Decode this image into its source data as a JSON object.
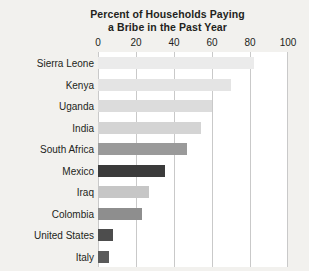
{
  "chart_data": {
    "type": "bar",
    "orientation": "horizontal",
    "title": "Percent of Households Paying a Bribe in the Past Year",
    "title_line1": "Percent of Households Paying",
    "title_line2": "a Bribe in the Past Year",
    "xlabel": "",
    "ylabel": "",
    "xlim": [
      0,
      100
    ],
    "grid": true,
    "legend": "none",
    "axis_position": "top",
    "tick_labels": [
      "0",
      "20",
      "40",
      "60",
      "80",
      "100"
    ],
    "ticks": [
      0,
      20,
      40,
      60,
      80,
      100
    ],
    "categories": [
      "Sierra Leone",
      "Kenya",
      "Uganda",
      "India",
      "South Africa",
      "Mexico",
      "Iraq",
      "Colombia",
      "United States",
      "Italy"
    ],
    "values": [
      82,
      70,
      60,
      54,
      47,
      35,
      27,
      23,
      8,
      6
    ],
    "bar_colors": [
      "#ebebeb",
      "#e4e4e4",
      "#dcdcdc",
      "#d4d4d4",
      "#9a9a9a",
      "#3b3b3b",
      "#c6c6c6",
      "#8e8e8e",
      "#4d4d4d",
      "#5a5a5a"
    ]
  },
  "colors": {
    "background": "#f2f1ee",
    "plot_background": "#ffffff",
    "gridline": "#c9c9c9",
    "text": "#231f20"
  }
}
